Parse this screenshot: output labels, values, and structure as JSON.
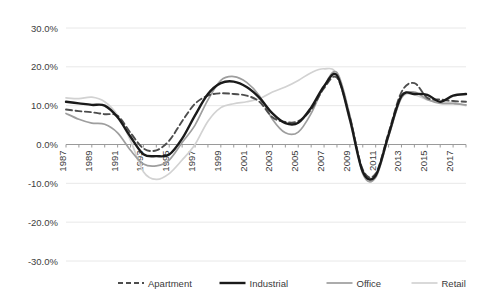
{
  "chart_data": {
    "type": "line",
    "title": "",
    "xlabel": "",
    "ylabel": "",
    "ylim": [
      -30,
      30
    ],
    "ytick_values": [
      30,
      20,
      10,
      0,
      -10,
      -20,
      -30
    ],
    "ytick_labels": [
      "30.0%",
      "20.0%",
      "10.0%",
      "0.0%",
      "-10.0%",
      "-20.0%",
      "-30.0%"
    ],
    "grid": true,
    "grid_axis": "y",
    "legend_position": "bottom",
    "x": [
      1987,
      1988,
      1989,
      1990,
      1991,
      1992,
      1993,
      1994,
      1995,
      1996,
      1997,
      1998,
      1999,
      2000,
      2001,
      2002,
      2003,
      2004,
      2005,
      2006,
      2007,
      2008,
      2009,
      2010,
      2011,
      2012,
      2013,
      2014,
      2015,
      2016,
      2017,
      2018
    ],
    "xtick_labels": [
      "1987",
      "1989",
      "1991",
      "1993",
      "1995",
      "1997",
      "1999",
      "2001",
      "2003",
      "2005",
      "2007",
      "2009",
      "2011",
      "2013",
      "2015",
      "2017"
    ],
    "xtick_step_years": 2,
    "xlim": [
      1987,
      2018
    ],
    "series": [
      {
        "name": "Apartment",
        "color": "#4d4d4d",
        "style": "dashed",
        "width": 1.9,
        "values": [
          9.0,
          8.6,
          8.3,
          7.8,
          7.4,
          3.0,
          -1.0,
          -1.5,
          1.0,
          6.0,
          10.5,
          12.6,
          13.2,
          13.0,
          12.6,
          11.0,
          7.0,
          5.8,
          6.0,
          9.0,
          14.5,
          17.2,
          7.0,
          -6.5,
          -7.5,
          3.0,
          13.5,
          15.8,
          12.0,
          11.6,
          11.2,
          11.0
        ]
      },
      {
        "name": "Industrial",
        "color": "#1a1a1a",
        "style": "solid",
        "width": 2.4,
        "values": [
          11.0,
          10.6,
          10.2,
          10.0,
          7.0,
          2.0,
          -2.5,
          -3.0,
          -2.6,
          1.5,
          7.5,
          13.0,
          15.8,
          16.2,
          14.8,
          12.0,
          8.0,
          5.5,
          5.6,
          9.5,
          15.0,
          17.8,
          6.5,
          -7.0,
          -8.0,
          2.5,
          12.5,
          13.0,
          12.8,
          11.0,
          12.6,
          13.0
        ]
      },
      {
        "name": "Office",
        "color": "#9e9e9e",
        "style": "solid",
        "width": 1.7,
        "values": [
          8.0,
          6.5,
          5.5,
          5.2,
          3.0,
          -1.5,
          -5.0,
          -5.5,
          -4.0,
          0.5,
          5.0,
          11.5,
          16.5,
          17.5,
          16.0,
          12.5,
          6.5,
          3.0,
          3.2,
          8.0,
          15.0,
          18.5,
          7.5,
          -7.5,
          -8.5,
          2.0,
          12.0,
          13.5,
          11.6,
          10.6,
          10.5,
          10.2
        ]
      },
      {
        "name": "Retail",
        "color": "#d2d2d2",
        "style": "solid",
        "width": 1.7,
        "values": [
          12.0,
          11.8,
          12.2,
          11.0,
          7.5,
          1.0,
          -7.0,
          -9.0,
          -7.5,
          -4.0,
          0.0,
          6.0,
          9.5,
          10.5,
          11.0,
          11.8,
          13.5,
          14.8,
          16.5,
          18.5,
          19.5,
          18.0,
          6.0,
          -6.5,
          -7.8,
          2.5,
          12.0,
          12.8,
          11.5,
          11.0,
          10.8,
          10.0
        ]
      }
    ]
  },
  "legend": {
    "items": [
      {
        "label": "Apartment"
      },
      {
        "label": "Industrial"
      },
      {
        "label": "Office"
      },
      {
        "label": "Retail"
      }
    ]
  }
}
